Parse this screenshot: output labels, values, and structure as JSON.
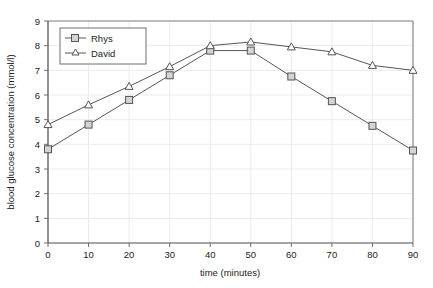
{
  "chart_data": {
    "type": "line",
    "title": "",
    "xlabel": "time (minutes)",
    "ylabel": "blood glucose concentration (mmol/l)",
    "x": [
      0,
      10,
      20,
      30,
      40,
      50,
      60,
      70,
      80,
      90
    ],
    "xlim": [
      0,
      90
    ],
    "ylim": [
      0,
      9
    ],
    "xticks": [
      "0",
      "10",
      "20",
      "30",
      "40",
      "50",
      "60",
      "70",
      "80",
      "90"
    ],
    "yticks": [
      "0",
      "1",
      "2",
      "3",
      "4",
      "5",
      "6",
      "7",
      "8",
      "9"
    ],
    "grid": true,
    "legend_position": "top-left",
    "series": [
      {
        "name": "Rhys",
        "marker": "square",
        "color": "#555555",
        "values": [
          3.8,
          4.8,
          5.8,
          6.8,
          7.8,
          7.8,
          6.75,
          5.75,
          4.75,
          3.75
        ]
      },
      {
        "name": "David",
        "marker": "triangle",
        "color": "#555555",
        "values": [
          4.8,
          5.6,
          6.35,
          7.15,
          8.0,
          8.15,
          7.95,
          7.75,
          7.2,
          7.0
        ]
      }
    ]
  },
  "legend": {
    "items": [
      {
        "label": "Rhys"
      },
      {
        "label": "David"
      }
    ]
  },
  "colors": {
    "line": "#555555",
    "marker_fill": "#d4d4d4",
    "grid": "#ebebeb",
    "axis": "#6e6e6e",
    "text": "#222222",
    "background": "#ffffff"
  }
}
